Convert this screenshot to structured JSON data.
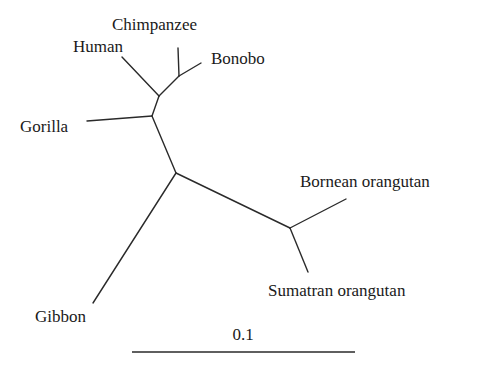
{
  "diagram": {
    "type": "unrooted-phylogenetic-tree",
    "colors": {
      "line": "#2a2a2a",
      "text": "#1a1a1a",
      "background": "#ffffff"
    },
    "taxa": [
      {
        "name": "Chimpanzee",
        "label_x": 112,
        "label_y": 30
      },
      {
        "name": "Human",
        "label_x": 73,
        "label_y": 52
      },
      {
        "name": "Bonobo",
        "label_x": 211,
        "label_y": 64
      },
      {
        "name": "Gorilla",
        "label_x": 20,
        "label_y": 132
      },
      {
        "name": "Bornean orangutan",
        "label_x": 300,
        "label_y": 187
      },
      {
        "name": "Sumatran orangutan",
        "label_x": 268,
        "label_y": 296
      },
      {
        "name": "Gibbon",
        "label_x": 35,
        "label_y": 322
      }
    ],
    "nodes": {
      "chimp_bonobo": [
        179,
        76
      ],
      "human_pan": [
        159,
        96
      ],
      "gorilla_join": [
        152,
        116
      ],
      "center": [
        176,
        173
      ],
      "orangutan": [
        290,
        228
      ]
    },
    "branches": [
      {
        "name": "human-branch",
        "from": [
          159,
          96
        ],
        "to": [
          122,
          57
        ]
      },
      {
        "name": "chimpanzee-branch",
        "from": [
          179,
          76
        ],
        "to": [
          178,
          48
        ]
      },
      {
        "name": "bonobo-branch",
        "from": [
          179,
          76
        ],
        "to": [
          201,
          63
        ]
      },
      {
        "name": "pan-internal-branch",
        "from": [
          159,
          96
        ],
        "to": [
          179,
          76
        ]
      },
      {
        "name": "human-pan-internal-branch",
        "from": [
          152,
          116
        ],
        "to": [
          159,
          96
        ]
      },
      {
        "name": "gorilla-branch",
        "from": [
          152,
          116
        ],
        "to": [
          87,
          121
        ]
      },
      {
        "name": "african-ape-internal-branch",
        "from": [
          176,
          173
        ],
        "to": [
          152,
          116
        ]
      },
      {
        "name": "gibbon-branch",
        "from": [
          176,
          173
        ],
        "to": [
          93,
          303
        ]
      },
      {
        "name": "orangutan-internal-branch",
        "from": [
          176,
          173
        ],
        "to": [
          290,
          228
        ]
      },
      {
        "name": "bornean-orangutan-branch",
        "from": [
          290,
          228
        ],
        "to": [
          346,
          199
        ]
      },
      {
        "name": "sumatran-orangutan-branch",
        "from": [
          290,
          228
        ],
        "to": [
          308,
          272
        ]
      }
    ],
    "scale_bar": {
      "label": "0.1",
      "x1": 132,
      "x2": 355,
      "y": 352,
      "label_x": 243,
      "label_y": 340
    }
  }
}
